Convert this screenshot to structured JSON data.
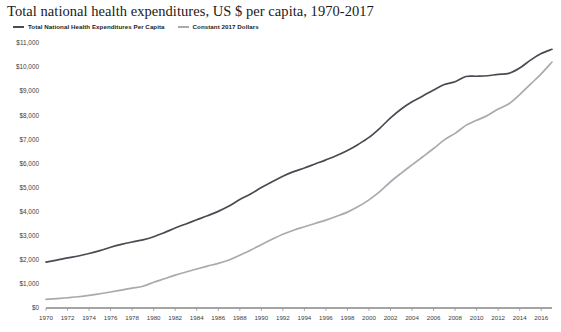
{
  "chart_data": {
    "type": "line",
    "title": "Total national health expenditures, US $ per capita, 1970-2017",
    "xlabel": "",
    "ylabel": "",
    "xlim": [
      1970,
      2017
    ],
    "ylim": [
      0,
      11000
    ],
    "grid": false,
    "legend_position": "top-left",
    "y_tick_labels": [
      "$11,000",
      "$10,000",
      "$9,000",
      "$8,000",
      "$7,000",
      "$6,000",
      "$5,000",
      "$4,000",
      "$3,000",
      "$2,000",
      "$1,000",
      "$0"
    ],
    "y_tick_values": [
      11000,
      10000,
      9000,
      8000,
      7000,
      6000,
      5000,
      4000,
      3000,
      2000,
      1000,
      0
    ],
    "x_tick_labels": [
      "1970",
      "1972",
      "1974",
      "1976",
      "1978",
      "1980",
      "1982",
      "1984",
      "1986",
      "1988",
      "1990",
      "1992",
      "1994",
      "1996",
      "1998",
      "2000",
      "2002",
      "2004",
      "2006",
      "2008",
      "2010",
      "2012",
      "2014",
      "2016"
    ],
    "x_tick_values": [
      1970,
      1972,
      1974,
      1976,
      1978,
      1980,
      1982,
      1984,
      1986,
      1988,
      1990,
      1992,
      1994,
      1996,
      1998,
      2000,
      2002,
      2004,
      2006,
      2008,
      2010,
      2012,
      2014,
      2016
    ],
    "x": [
      1970,
      1971,
      1972,
      1973,
      1974,
      1975,
      1976,
      1977,
      1978,
      1979,
      1980,
      1981,
      1982,
      1983,
      1984,
      1985,
      1986,
      1987,
      1988,
      1989,
      1990,
      1991,
      1992,
      1993,
      1994,
      1995,
      1996,
      1997,
      1998,
      1999,
      2000,
      2001,
      2002,
      2003,
      2004,
      2005,
      2006,
      2007,
      2008,
      2009,
      2010,
      2011,
      2012,
      2013,
      2014,
      2015,
      2016,
      2017
    ],
    "series": [
      {
        "name": "Constant 2017 Dollars",
        "color": "#4a4a52",
        "values": [
          1905,
          1990,
          2080,
          2160,
          2260,
          2380,
          2520,
          2640,
          2740,
          2830,
          2960,
          3130,
          3320,
          3490,
          3660,
          3830,
          4010,
          4230,
          4500,
          4730,
          5000,
          5240,
          5470,
          5660,
          5810,
          5980,
          6150,
          6330,
          6540,
          6790,
          7080,
          7460,
          7890,
          8260,
          8560,
          8800,
          9050,
          9280,
          9390,
          9610,
          9620,
          9640,
          9700,
          9740,
          9960,
          10290,
          10560,
          10740
        ]
      },
      {
        "name": "Total National Health Expenditures Per Capita",
        "color": "#a9a9b0",
        "values": [
          355,
          388,
          425,
          466,
          521,
          591,
          665,
          745,
          822,
          905,
          1067,
          1215,
          1365,
          1493,
          1620,
          1740,
          1850,
          1990,
          2190,
          2400,
          2630,
          2850,
          3060,
          3230,
          3370,
          3510,
          3650,
          3810,
          3980,
          4210,
          4490,
          4830,
          5240,
          5600,
          5940,
          6280,
          6620,
          6980,
          7250,
          7580,
          7790,
          7990,
          8260,
          8480,
          8860,
          9290,
          9720,
          10210
        ]
      }
    ]
  }
}
